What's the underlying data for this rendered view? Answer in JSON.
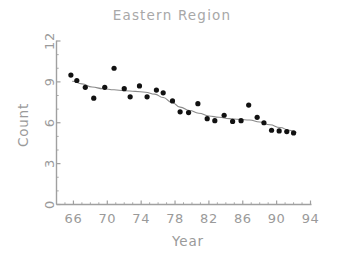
{
  "chart_data": {
    "type": "scatter",
    "title": "Eastern Region",
    "xlabel": "Year",
    "ylabel": "Count",
    "xlim": [
      64,
      94
    ],
    "ylim": [
      0,
      12
    ],
    "xticks": [
      66,
      70,
      74,
      78,
      82,
      86,
      90,
      94
    ],
    "xtick_labels": [
      "66",
      "70",
      "74",
      "78",
      "82",
      "86",
      "90",
      "94"
    ],
    "yticks": [
      0,
      3,
      6,
      9,
      12
    ],
    "ytick_labels": [
      "0",
      "3",
      "6",
      "9",
      "12"
    ],
    "grid": false,
    "legend": "none",
    "marker_color": "#111111",
    "line_color": "#8a8a8a",
    "axis_color": "#a0a0a0",
    "points": [
      {
        "x": 65.7,
        "y": 9.5
      },
      {
        "x": 66.4,
        "y": 9.1
      },
      {
        "x": 67.4,
        "y": 8.6
      },
      {
        "x": 68.4,
        "y": 7.8
      },
      {
        "x": 69.7,
        "y": 8.6
      },
      {
        "x": 70.8,
        "y": 10.0
      },
      {
        "x": 72.0,
        "y": 8.5
      },
      {
        "x": 72.7,
        "y": 7.9
      },
      {
        "x": 73.8,
        "y": 8.7
      },
      {
        "x": 74.7,
        "y": 7.9
      },
      {
        "x": 75.8,
        "y": 8.4
      },
      {
        "x": 76.6,
        "y": 8.2
      },
      {
        "x": 77.7,
        "y": 7.6
      },
      {
        "x": 78.6,
        "y": 6.8
      },
      {
        "x": 79.6,
        "y": 6.75
      },
      {
        "x": 80.7,
        "y": 7.4
      },
      {
        "x": 81.8,
        "y": 6.3
      },
      {
        "x": 82.7,
        "y": 6.15
      },
      {
        "x": 83.8,
        "y": 6.55
      },
      {
        "x": 84.8,
        "y": 6.1
      },
      {
        "x": 85.8,
        "y": 6.15
      },
      {
        "x": 86.7,
        "y": 7.3
      },
      {
        "x": 87.7,
        "y": 6.4
      },
      {
        "x": 88.5,
        "y": 6.0
      },
      {
        "x": 89.4,
        "y": 5.45
      },
      {
        "x": 90.3,
        "y": 5.4
      },
      {
        "x": 91.2,
        "y": 5.35
      },
      {
        "x": 92.0,
        "y": 5.25
      }
    ],
    "smooth_line": [
      {
        "x": 65.9,
        "y": 9.05
      },
      {
        "x": 67.0,
        "y": 8.85
      },
      {
        "x": 68.2,
        "y": 8.62
      },
      {
        "x": 69.5,
        "y": 8.5
      },
      {
        "x": 70.8,
        "y": 8.42
      },
      {
        "x": 72.0,
        "y": 8.35
      },
      {
        "x": 73.3,
        "y": 8.3
      },
      {
        "x": 74.5,
        "y": 8.24
      },
      {
        "x": 75.6,
        "y": 8.1
      },
      {
        "x": 76.6,
        "y": 7.85
      },
      {
        "x": 77.6,
        "y": 7.5
      },
      {
        "x": 78.6,
        "y": 7.15
      },
      {
        "x": 79.7,
        "y": 6.9
      },
      {
        "x": 80.8,
        "y": 6.7
      },
      {
        "x": 82.0,
        "y": 6.5
      },
      {
        "x": 83.2,
        "y": 6.4
      },
      {
        "x": 84.4,
        "y": 6.3
      },
      {
        "x": 85.6,
        "y": 6.25
      },
      {
        "x": 86.8,
        "y": 6.2
      },
      {
        "x": 88.0,
        "y": 6.05
      },
      {
        "x": 89.2,
        "y": 5.85
      },
      {
        "x": 90.4,
        "y": 5.65
      },
      {
        "x": 91.5,
        "y": 5.45
      },
      {
        "x": 92.3,
        "y": 5.3
      }
    ]
  }
}
